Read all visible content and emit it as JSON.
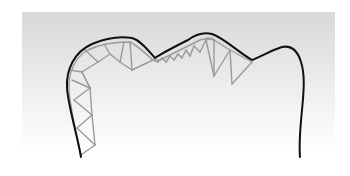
{
  "diagram": {
    "colors": {
      "background_top": "#d9d9d9",
      "background_bottom": "#ffffff",
      "outline": "#111111",
      "truss": "#9a9a9a"
    },
    "outline_path": "M81,157 C76,130 68,105 67,88 C66,70 74,52 92,44 C106,38 120,36 132,38 C140,40 148,50 155,58 C164,52 176,46 188,40 C196,34 204,32 212,34 C224,38 238,52 252,60 C262,56 272,50 282,47 C292,45 298,52 301,62 C305,74 304,90 302,110 C300,130 299,145 300,157",
    "truss_outer_path": "M81,155 C76,130 70,108 69,90 C68,74 74,58 88,50 C100,44 116,42 130,42 C138,46 146,54 153,60 L160,60 L168,56 L176,52 L184,48 L192,44 L200,40 L208,38 L214,40",
    "truss_members": [
      [
        81,
        155,
        95,
        145
      ],
      [
        95,
        145,
        77,
        128
      ],
      [
        77,
        128,
        92,
        115
      ],
      [
        92,
        115,
        74,
        100
      ],
      [
        74,
        100,
        90,
        88
      ],
      [
        90,
        88,
        72,
        80
      ],
      [
        95,
        145,
        92,
        115
      ],
      [
        92,
        115,
        90,
        88
      ],
      [
        90,
        88,
        82,
        72
      ],
      [
        82,
        72,
        70,
        70
      ],
      [
        82,
        72,
        98,
        62
      ],
      [
        98,
        62,
        85,
        50
      ],
      [
        98,
        62,
        110,
        54
      ],
      [
        110,
        54,
        104,
        44
      ],
      [
        110,
        54,
        120,
        62
      ],
      [
        120,
        62,
        124,
        42
      ],
      [
        120,
        62,
        132,
        70
      ],
      [
        132,
        70,
        130,
        42
      ],
      [
        132,
        70,
        153,
        60
      ],
      [
        82,
        72,
        90,
        88
      ],
      [
        153,
        60,
        158,
        62
      ],
      [
        158,
        62,
        162,
        58
      ],
      [
        162,
        58,
        166,
        62
      ],
      [
        166,
        62,
        170,
        56
      ],
      [
        170,
        56,
        174,
        60
      ],
      [
        174,
        60,
        178,
        54
      ],
      [
        178,
        54,
        182,
        58
      ],
      [
        182,
        58,
        186,
        50
      ],
      [
        186,
        50,
        190,
        56
      ],
      [
        190,
        56,
        194,
        46
      ],
      [
        194,
        46,
        200,
        52
      ],
      [
        200,
        52,
        206,
        40
      ],
      [
        206,
        40,
        212,
        38
      ],
      [
        206,
        40,
        214,
        76
      ],
      [
        214,
        76,
        214,
        40
      ],
      [
        214,
        40,
        230,
        50
      ],
      [
        214,
        76,
        230,
        50
      ],
      [
        230,
        50,
        232,
        84
      ],
      [
        232,
        84,
        252,
        62
      ],
      [
        230,
        50,
        252,
        62
      ]
    ]
  }
}
